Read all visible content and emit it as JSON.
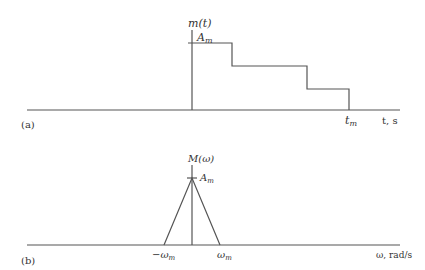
{
  "figure": {
    "panel_a": {
      "label": "(a)",
      "y_axis_label": "m(t)",
      "x_axis_label": "t, s",
      "amplitude_label": "A",
      "amplitude_sub": "m",
      "end_time_label": "t",
      "end_time_sub": "m",
      "description": "Staircase decreasing pulse starting at t=0 with amplitude A_m, ending at t_m"
    },
    "panel_b": {
      "label": "(b)",
      "y_axis_label": "M(ω)",
      "x_axis_label": "ω, rad/s",
      "amplitude_label": "A",
      "amplitude_sub": "m",
      "neg_freq_label": "−ω",
      "neg_freq_sub": "m",
      "pos_freq_label": "ω",
      "pos_freq_sub": "m",
      "description": "Triangular spectrum centered at ω=0 with peak A_m, bandwidth from −ω_m to ω_m"
    }
  }
}
